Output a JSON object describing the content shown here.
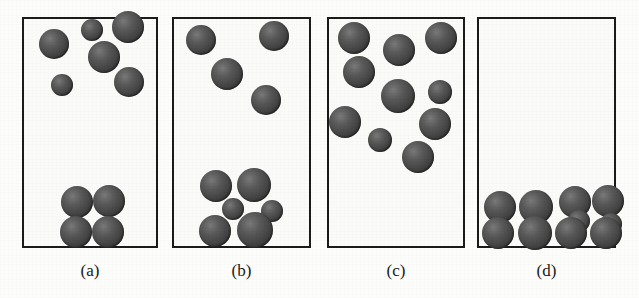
{
  "figure": {
    "type": "particle-distribution-diagram",
    "background_color": "#fdfdfb",
    "sphere_color": "#4a4a4a",
    "border_color": "#1b1b1b",
    "canvas": {
      "width": 639,
      "height": 298
    }
  },
  "panels": [
    {
      "id": "panel-a",
      "label": "(a)",
      "box": {
        "x": 22,
        "y": 17,
        "width": 136,
        "height": 231
      },
      "label_y": 261,
      "sphere_count": 10,
      "spheres": [
        {
          "cx": 54,
          "cy": 44,
          "r": 15
        },
        {
          "cx": 92,
          "cy": 30,
          "r": 11
        },
        {
          "cx": 128,
          "cy": 27,
          "r": 16
        },
        {
          "cx": 104,
          "cy": 57,
          "r": 16
        },
        {
          "cx": 62,
          "cy": 85,
          "r": 11
        },
        {
          "cx": 129,
          "cy": 82,
          "r": 15
        },
        {
          "cx": 77,
          "cy": 202,
          "r": 16
        },
        {
          "cx": 109,
          "cy": 201,
          "r": 16
        },
        {
          "cx": 76,
          "cy": 232,
          "r": 16
        },
        {
          "cx": 108,
          "cy": 232,
          "r": 16
        }
      ]
    },
    {
      "id": "panel-b",
      "label": "(b)",
      "box": {
        "x": 172,
        "y": 17,
        "width": 139,
        "height": 231
      },
      "label_y": 261,
      "sphere_count": 10,
      "spheres": [
        {
          "cx": 201,
          "cy": 40,
          "r": 15
        },
        {
          "cx": 274,
          "cy": 36,
          "r": 15
        },
        {
          "cx": 227,
          "cy": 74,
          "r": 16
        },
        {
          "cx": 266,
          "cy": 100,
          "r": 15
        },
        {
          "cx": 216,
          "cy": 186,
          "r": 16
        },
        {
          "cx": 254,
          "cy": 185,
          "r": 17
        },
        {
          "cx": 233,
          "cy": 209,
          "r": 11
        },
        {
          "cx": 272,
          "cy": 211,
          "r": 11
        },
        {
          "cx": 215,
          "cy": 231,
          "r": 16
        },
        {
          "cx": 255,
          "cy": 230,
          "r": 18
        }
      ]
    },
    {
      "id": "panel-c",
      "label": "(c)",
      "box": {
        "x": 327,
        "y": 17,
        "width": 138,
        "height": 231
      },
      "label_y": 261,
      "sphere_count": 11,
      "spheres": [
        {
          "cx": 354,
          "cy": 38,
          "r": 16
        },
        {
          "cx": 399,
          "cy": 50,
          "r": 16
        },
        {
          "cx": 441,
          "cy": 38,
          "r": 16
        },
        {
          "cx": 359,
          "cy": 72,
          "r": 16
        },
        {
          "cx": 398,
          "cy": 96,
          "r": 17
        },
        {
          "cx": 440,
          "cy": 92,
          "r": 12
        },
        {
          "cx": 345,
          "cy": 122,
          "r": 16
        },
        {
          "cx": 435,
          "cy": 124,
          "r": 16
        },
        {
          "cx": 380,
          "cy": 140,
          "r": 12
        },
        {
          "cx": 418,
          "cy": 157,
          "r": 16
        }
      ]
    },
    {
      "id": "panel-d",
      "label": "(d)",
      "box": {
        "x": 477,
        "y": 17,
        "width": 139,
        "height": 231
      },
      "label_y": 261,
      "sphere_count": 10,
      "spheres": [
        {
          "cx": 500,
          "cy": 207,
          "r": 16
        },
        {
          "cx": 536,
          "cy": 207,
          "r": 17
        },
        {
          "cx": 575,
          "cy": 202,
          "r": 16
        },
        {
          "cx": 608,
          "cy": 201,
          "r": 16
        },
        {
          "cx": 579,
          "cy": 221,
          "r": 11
        },
        {
          "cx": 611,
          "cy": 224,
          "r": 11
        },
        {
          "cx": 498,
          "cy": 233,
          "r": 16
        },
        {
          "cx": 535,
          "cy": 233,
          "r": 17
        },
        {
          "cx": 571,
          "cy": 233,
          "r": 16
        },
        {
          "cx": 606,
          "cy": 233,
          "r": 16
        }
      ]
    }
  ]
}
